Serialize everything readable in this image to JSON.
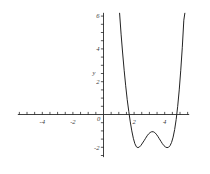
{
  "chart_data": {
    "type": "line",
    "title": "",
    "subtitle": "",
    "xlabel": "",
    "ylabel": "y",
    "xlim": [
      -5.6,
      5.6
    ],
    "ylim": [
      -2.6,
      6.2
    ],
    "grid": false,
    "legend": null,
    "x_ticks_labeled": [
      -4,
      -2,
      2,
      4
    ],
    "x_tick_labels": [
      "-4",
      "-2",
      "2",
      "4"
    ],
    "x_minor_tick_step": 0.5,
    "y_ticks_labeled": [
      0,
      2,
      4,
      6,
      -2
    ],
    "y_tick_labels": [
      "0",
      "2",
      "4",
      "6",
      "-2"
    ],
    "y_minor_tick_step": 0.5,
    "axis_origin_label": "0",
    "x_intercepts": [
      1.5,
      4.8
    ],
    "local_minima": [
      {
        "x": 2.1,
        "y": -2.0
      },
      {
        "x": 4.3,
        "y": -2.0
      }
    ],
    "local_maxima": [
      {
        "x": 3.2,
        "y": -1.05
      }
    ],
    "series": [
      {
        "name": "quartic",
        "points": [
          [
            1.05,
            6.2
          ],
          [
            1.15,
            4.9
          ],
          [
            1.25,
            3.75
          ],
          [
            1.35,
            2.7
          ],
          [
            1.45,
            1.75
          ],
          [
            1.55,
            0.9
          ],
          [
            1.65,
            0.2
          ],
          [
            1.75,
            -0.45
          ],
          [
            1.85,
            -1.0
          ],
          [
            1.95,
            -1.45
          ],
          [
            2.05,
            -1.78
          ],
          [
            2.15,
            -1.97
          ],
          [
            2.25,
            -2.02
          ],
          [
            2.35,
            -1.98
          ],
          [
            2.45,
            -1.88
          ],
          [
            2.55,
            -1.74
          ],
          [
            2.65,
            -1.6
          ],
          [
            2.75,
            -1.45
          ],
          [
            2.85,
            -1.3
          ],
          [
            2.95,
            -1.18
          ],
          [
            3.05,
            -1.1
          ],
          [
            3.15,
            -1.05
          ],
          [
            3.25,
            -1.05
          ],
          [
            3.35,
            -1.1
          ],
          [
            3.45,
            -1.2
          ],
          [
            3.55,
            -1.33
          ],
          [
            3.65,
            -1.48
          ],
          [
            3.75,
            -1.63
          ],
          [
            3.85,
            -1.78
          ],
          [
            3.95,
            -1.9
          ],
          [
            4.05,
            -1.98
          ],
          [
            4.15,
            -2.02
          ],
          [
            4.25,
            -2.0
          ],
          [
            4.35,
            -1.9
          ],
          [
            4.45,
            -1.7
          ],
          [
            4.55,
            -1.38
          ],
          [
            4.65,
            -0.92
          ],
          [
            4.75,
            -0.3
          ],
          [
            4.85,
            0.5
          ],
          [
            4.95,
            1.5
          ],
          [
            5.05,
            2.7
          ],
          [
            5.15,
            4.1
          ],
          [
            5.25,
            5.75
          ],
          [
            5.32,
            6.2
          ]
        ]
      }
    ]
  }
}
